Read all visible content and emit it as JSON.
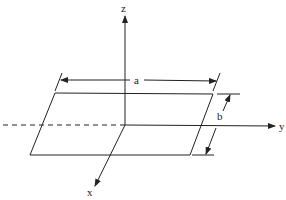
{
  "diagram": {
    "type": "3d-axes-plate",
    "axes": {
      "x": {
        "label": "x"
      },
      "y": {
        "label": "y"
      },
      "z": {
        "label": "z"
      }
    },
    "dimensions": {
      "a": {
        "label": "a"
      },
      "b": {
        "label": "b"
      }
    },
    "colors": {
      "line": "#222222",
      "background": "#ffffff"
    }
  }
}
